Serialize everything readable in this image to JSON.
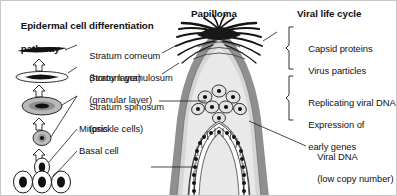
{
  "figure": {
    "background_color": "#ffffff",
    "border_color": "#c8c8c8",
    "width": 397,
    "height": 196
  },
  "left_panel": {
    "title_line1": "Epidermal cell differentiation",
    "title_line2": "pathway",
    "labels": [
      {
        "id": "stratum-corneum",
        "line1": "Stratum corneum",
        "line2": "(horny layer)"
      },
      {
        "id": "stratum-granulosum",
        "line1": "Stratum granulosum",
        "line2": "(granular layer)"
      },
      {
        "id": "stratum-spinosum",
        "line1": "Stratum spinosum",
        "line2": "(prickle cells)"
      },
      {
        "id": "mitosis",
        "line1": "Mitosis",
        "line2": ""
      },
      {
        "id": "basal-cell",
        "line1": "Basal cell",
        "line2": ""
      }
    ]
  },
  "center_panel": {
    "title": "Papilloma",
    "colors": {
      "outer_band": "#8c8c8c",
      "tissue_fill": "#d9d9d9",
      "inner_fill": "#e8e8e8",
      "spike_color": "#1a1a1a",
      "cell_outline": "#1a1a1a"
    }
  },
  "right_panel": {
    "title": "Viral life cycle",
    "groups": [
      {
        "id": "capsid-group",
        "lines": [
          "Capsid proteins",
          "Virus particles"
        ],
        "bracket": true
      },
      {
        "id": "replicating-group",
        "lines": [
          "Replicating viral DNA",
          "Expression of",
          "early genes"
        ],
        "bracket": true
      },
      {
        "id": "viral-dna-group",
        "lines": [
          "Viral DNA",
          "(low copy number)"
        ],
        "bracket": false
      }
    ]
  }
}
